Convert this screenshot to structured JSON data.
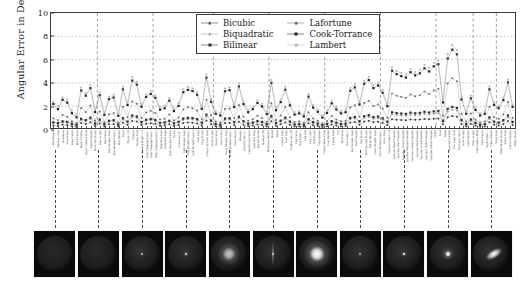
{
  "chart_data": {
    "type": "line",
    "title": "",
    "xlabel": "",
    "ylabel": "Angular Error in Degrees",
    "ylim": [
      0,
      10
    ],
    "yticks": [
      0,
      2,
      4,
      6,
      8,
      10
    ],
    "grid": true,
    "legend_position": "top-center-inside",
    "n_categories": 100,
    "categories": [
      "Alum Bronze",
      "Alumina Oxide",
      "Aluminium",
      "Aventurnine",
      "Beige Fabric",
      "Black Fabric",
      "Black Obsidian",
      "Black Oxidized Steel",
      "Black Phenolic",
      "Black Soft Plastic",
      "Blue Acrylic",
      "Blue Fabric",
      "Blue Metallic Paint",
      "Blue Metallic Paint 2",
      "Blue Rubber",
      "Brass",
      "Cherry 235",
      "Chrome",
      "Chrome Steel",
      "Colonial Maple 223",
      "Color Changing Paint 1",
      "Color Changing Paint 2",
      "Color Changing Paint 3",
      "Dark Blue Paint",
      "Dark Red Paint",
      "Dark Specular Fabric",
      "Delrin",
      "Fruitwood 241",
      "Gold Metallic Paint",
      "Gold Metallic Paint 2",
      "Gold Metallic Paint 3",
      "Gold Paint",
      "Gray Plastic",
      "Grease Covered Steel",
      "Green Acrylic",
      "Green Fabric",
      "Green Latex",
      "Green Metallic Paint",
      "Green Metallic Paint 2",
      "Green Plastic",
      "Hematite",
      "Ipswich Pine 221",
      "Light Brown Fabric",
      "Light Red Paint",
      "Maroon Plastic",
      "Natural 209",
      "Neoprene Rubber",
      "Nickel",
      "Nylon",
      "Orange Paint",
      "Pearl Paint",
      "Pickled Oak 260",
      "Pink Fabric",
      "Pink Fabric 2",
      "Pink Felt",
      "Pink Jasper",
      "Pink Plastic",
      "Polyethylene",
      "Polyurethane Foam",
      "Pure Rubber",
      "Purple Paint",
      "PVC",
      "Red Fabric",
      "Red Fabric 2",
      "Red Metallic Paint",
      "Red Phenolic",
      "Red Plastic",
      "Red Specular Plastic",
      "Silicon Nitrade",
      "Silver Metallic Paint",
      "Silver Metallic Paint 2",
      "Silver Paint",
      "Special Walnut 224",
      "Specular Black Phenolic",
      "Specular Blue Phenolic",
      "Specular Green Phenolic",
      "Specular Maroon Phenolic",
      "Specular Orange Phenolic",
      "Specular Red Phenolic",
      "Specular Violet Phenolic",
      "Specular White Phenolic",
      "Specular Yellow Phenolic",
      "SS440",
      "Steel",
      "Teflon",
      "Tungsten Carbide",
      "Two Layer Gold",
      "Two Layer Silver",
      "Violet Acrylic",
      "Violet Rubber",
      "White Acrylic",
      "White Diffuse Bball",
      "White Fabric",
      "White Fabric 2",
      "White Marble",
      "White Paint",
      "Yellow Matte Plastic",
      "Yellow Paint",
      "Yellow Phenolic",
      "Yellow Plastic"
    ],
    "series": [
      {
        "name": "Bicubic",
        "color": "#3d3d3d",
        "marker": "dot",
        "values": [
          0.35,
          0.3,
          0.42,
          0.38,
          0.28,
          0.22,
          0.55,
          0.48,
          0.62,
          0.3,
          0.52,
          0.26,
          0.44,
          0.47,
          0.25,
          0.58,
          0.4,
          0.72,
          0.68,
          0.38,
          0.5,
          0.54,
          0.49,
          0.33,
          0.36,
          0.44,
          0.31,
          0.39,
          0.56,
          0.6,
          0.58,
          0.52,
          0.34,
          0.78,
          0.46,
          0.27,
          0.24,
          0.55,
          0.57,
          0.37,
          0.66,
          0.41,
          0.29,
          0.35,
          0.43,
          0.38,
          0.26,
          0.7,
          0.32,
          0.45,
          0.61,
          0.4,
          0.25,
          0.27,
          0.23,
          0.53,
          0.36,
          0.3,
          0.21,
          0.28,
          0.42,
          0.34,
          0.27,
          0.29,
          0.59,
          0.64,
          0.41,
          0.68,
          0.74,
          0.63,
          0.66,
          0.57,
          0.39,
          0.88,
          0.84,
          0.82,
          0.8,
          0.86,
          0.83,
          0.85,
          0.9,
          0.87,
          0.92,
          0.95,
          0.44,
          1.05,
          1.15,
          1.1,
          0.48,
          0.26,
          0.5,
          0.33,
          0.24,
          0.26,
          0.62,
          0.4,
          0.35,
          0.47,
          0.72,
          0.38
        ]
      },
      {
        "name": "Biquadratic",
        "color": "#9a9a9a",
        "marker": "dot",
        "values": [
          0.55,
          0.48,
          0.62,
          0.58,
          0.44,
          0.36,
          0.8,
          0.7,
          0.9,
          0.46,
          0.76,
          0.4,
          0.66,
          0.7,
          0.38,
          0.85,
          0.6,
          1.05,
          0.98,
          0.56,
          0.74,
          0.8,
          0.72,
          0.5,
          0.54,
          0.66,
          0.47,
          0.58,
          0.82,
          0.88,
          0.86,
          0.78,
          0.52,
          1.12,
          0.68,
          0.42,
          0.37,
          0.82,
          0.85,
          0.56,
          0.96,
          0.62,
          0.45,
          0.53,
          0.64,
          0.57,
          0.4,
          1.02,
          0.49,
          0.67,
          0.9,
          0.6,
          0.39,
          0.42,
          0.36,
          0.78,
          0.55,
          0.46,
          0.33,
          0.43,
          0.63,
          0.52,
          0.42,
          0.45,
          0.87,
          0.94,
          0.62,
          1.0,
          1.08,
          0.93,
          0.97,
          0.84,
          0.59,
          1.3,
          1.24,
          1.2,
          1.18,
          1.27,
          1.22,
          1.25,
          1.33,
          1.28,
          1.36,
          1.4,
          0.66,
          1.55,
          1.7,
          1.62,
          0.72,
          0.4,
          0.75,
          0.5,
          0.37,
          0.4,
          0.92,
          0.6,
          0.53,
          0.7,
          1.06,
          0.57
        ]
      },
      {
        "name": "Bilinear",
        "color": "#2e2e2e",
        "marker": "square",
        "values": [
          0.62,
          0.55,
          0.7,
          0.66,
          0.5,
          0.41,
          0.92,
          0.8,
          1.02,
          0.52,
          0.86,
          0.45,
          0.75,
          0.8,
          0.43,
          0.97,
          0.68,
          1.2,
          1.12,
          0.64,
          0.84,
          0.91,
          0.82,
          0.57,
          0.62,
          0.75,
          0.53,
          0.66,
          0.94,
          1.0,
          0.98,
          0.89,
          0.59,
          1.28,
          0.77,
          0.48,
          0.42,
          0.94,
          0.97,
          0.64,
          1.1,
          0.71,
          0.51,
          0.6,
          0.73,
          0.65,
          0.46,
          1.16,
          0.56,
          0.76,
          1.02,
          0.68,
          0.44,
          0.48,
          0.41,
          0.89,
          0.63,
          0.52,
          0.38,
          0.49,
          0.72,
          0.59,
          0.48,
          0.51,
          0.99,
          1.07,
          0.71,
          1.14,
          1.23,
          1.06,
          1.11,
          0.96,
          0.67,
          1.48,
          1.41,
          1.37,
          1.34,
          1.45,
          1.39,
          1.43,
          1.52,
          1.46,
          1.55,
          1.6,
          0.75,
          1.77,
          1.94,
          1.85,
          0.82,
          0.46,
          0.86,
          0.57,
          0.42,
          0.46,
          1.05,
          0.68,
          0.6,
          0.8,
          1.21,
          0.65
        ]
      },
      {
        "name": "Lafortune",
        "color": "#6e6e6e",
        "marker": "dot",
        "values": [
          0.95,
          0.8,
          1.25,
          1.1,
          0.7,
          0.55,
          1.85,
          1.5,
          2.05,
          0.75,
          1.55,
          0.62,
          1.3,
          1.4,
          0.58,
          1.95,
          1.05,
          2.4,
          2.2,
          0.98,
          1.45,
          1.6,
          1.42,
          0.85,
          0.92,
          1.28,
          0.78,
          1.02,
          1.72,
          1.9,
          1.82,
          1.62,
          0.88,
          2.55,
          1.22,
          0.68,
          0.6,
          1.75,
          1.8,
          0.96,
          2.1,
          1.12,
          0.74,
          0.88,
          1.18,
          0.98,
          0.66,
          2.25,
          0.82,
          1.2,
          1.92,
          1.05,
          0.64,
          0.7,
          0.57,
          1.48,
          0.94,
          0.76,
          0.52,
          0.72,
          1.15,
          0.86,
          0.7,
          0.75,
          1.88,
          2.08,
          1.1,
          2.28,
          2.45,
          2.02,
          2.15,
          1.78,
          1.0,
          3.1,
          2.9,
          2.8,
          2.72,
          3.0,
          2.85,
          2.95,
          3.25,
          3.05,
          3.35,
          3.5,
          1.18,
          3.95,
          4.4,
          4.15,
          1.32,
          0.68,
          1.38,
          0.84,
          0.6,
          0.68,
          1.95,
          1.06,
          0.92,
          1.28,
          2.35,
          0.98
        ]
      },
      {
        "name": "Cook-Torrance",
        "color": "#1f1f1f",
        "marker": "square",
        "values": [
          2.2,
          1.75,
          2.55,
          2.3,
          1.4,
          1.05,
          3.35,
          2.9,
          3.55,
          1.5,
          2.95,
          1.25,
          2.6,
          2.75,
          1.18,
          3.45,
          2.1,
          4.2,
          3.85,
          1.95,
          2.8,
          3.05,
          2.72,
          1.7,
          1.82,
          2.48,
          1.58,
          2.02,
          3.2,
          3.4,
          3.3,
          2.98,
          1.78,
          4.45,
          2.38,
          1.35,
          1.2,
          3.28,
          3.38,
          1.92,
          3.7,
          2.18,
          1.48,
          1.75,
          2.28,
          1.98,
          1.32,
          4.0,
          1.65,
          2.35,
          3.42,
          2.08,
          1.28,
          1.38,
          1.12,
          2.82,
          1.88,
          1.52,
          1.02,
          1.42,
          2.25,
          1.72,
          1.38,
          1.48,
          3.32,
          3.62,
          2.15,
          3.92,
          4.25,
          3.55,
          3.78,
          3.15,
          2.0,
          5.05,
          4.75,
          4.58,
          4.45,
          4.92,
          4.65,
          4.82,
          5.25,
          4.98,
          5.42,
          5.6,
          2.32,
          6.1,
          6.85,
          6.45,
          2.58,
          1.35,
          2.68,
          1.68,
          1.2,
          1.35,
          3.45,
          2.12,
          1.82,
          2.52,
          4.05,
          1.95
        ]
      },
      {
        "name": "Lambert",
        "color": "#b5b5b5",
        "marker": "dot",
        "values": [
          2.4,
          2.0,
          2.75,
          2.55,
          1.62,
          1.28,
          3.6,
          3.1,
          3.8,
          1.72,
          3.18,
          1.45,
          2.82,
          2.98,
          1.38,
          3.7,
          2.32,
          4.5,
          4.1,
          2.18,
          3.02,
          3.28,
          2.95,
          1.92,
          2.05,
          2.7,
          1.8,
          2.25,
          3.45,
          3.65,
          3.55,
          3.22,
          2.0,
          4.72,
          2.6,
          1.55,
          1.4,
          3.52,
          3.62,
          2.14,
          3.95,
          2.4,
          1.68,
          1.98,
          2.5,
          2.2,
          1.52,
          4.25,
          1.88,
          2.58,
          3.68,
          2.3,
          1.48,
          1.58,
          1.32,
          3.05,
          2.1,
          1.72,
          1.22,
          1.62,
          2.48,
          1.95,
          1.58,
          1.68,
          3.56,
          3.88,
          2.38,
          4.18,
          4.52,
          3.8,
          4.02,
          3.38,
          2.22,
          5.35,
          5.02,
          4.85,
          4.72,
          5.2,
          4.92,
          5.1,
          5.55,
          5.28,
          5.72,
          5.92,
          2.55,
          6.45,
          7.25,
          6.82,
          2.82,
          1.55,
          2.92,
          1.88,
          1.4,
          1.55,
          3.7,
          2.35,
          2.02,
          2.75,
          4.3,
          2.15
        ]
      }
    ],
    "group_separators": [
      9.5,
      21.5,
      34.5,
      46.5,
      58.5,
      70.5,
      82.5,
      90.5,
      95.5
    ]
  },
  "thumbnails": {
    "name": "brdf-sphere-renders",
    "count": 11,
    "items": [
      {
        "highlight": "none",
        "radius": 0,
        "brightness": 0.16
      },
      {
        "highlight": "none",
        "radius": 0,
        "brightness": 0.19
      },
      {
        "highlight": "pinpoint",
        "radius": 2,
        "brightness": 0.95
      },
      {
        "highlight": "pinpoint",
        "radius": 3,
        "brightness": 0.8
      },
      {
        "highlight": "broad",
        "radius": 11,
        "brightness": 0.7
      },
      {
        "highlight": "streak",
        "radius": 2,
        "brightness": 0.75
      },
      {
        "highlight": "broad",
        "radius": 13,
        "brightness": 1.0
      },
      {
        "highlight": "pinpoint",
        "radius": 2,
        "brightness": 0.9
      },
      {
        "highlight": "pinpoint",
        "radius": 3,
        "brightness": 0.95
      },
      {
        "highlight": "tight",
        "radius": 6,
        "brightness": 1.0
      },
      {
        "highlight": "anisotropic",
        "radius": 8,
        "brightness": 1.0
      }
    ]
  }
}
